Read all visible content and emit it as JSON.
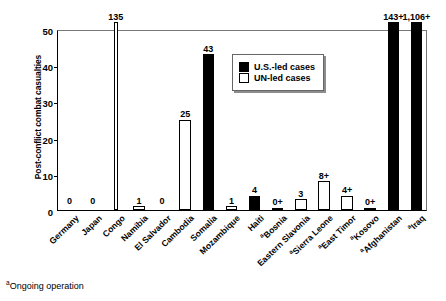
{
  "chart_data": {
    "type": "bar",
    "title": "",
    "xlabel": "",
    "ylabel": "Post-conflict combat casualties",
    "ylim": [
      0,
      50
    ],
    "yticks": [
      0,
      10,
      20,
      30,
      40,
      50
    ],
    "grid": false,
    "legend_position": "inside-top-center",
    "categories": [
      "Germany",
      "Japan",
      "Congo",
      "Namibia",
      "El Salvador",
      "Cambodia",
      "Somalia",
      "Mozambique",
      "Haiti",
      "Bosnia",
      "Eastern Slavonia",
      "Sierra Leone",
      "East Timor",
      "Kosovo",
      "Afghanistan",
      "Iraq"
    ],
    "series": [
      {
        "name": "U.S.-led cases",
        "color": "#000000",
        "values": [
          0,
          0,
          null,
          null,
          null,
          null,
          43,
          null,
          4,
          0,
          null,
          null,
          null,
          0,
          143,
          1106
        ]
      },
      {
        "name": "UN-led cases",
        "color": "#ffffff",
        "values": [
          null,
          null,
          135,
          1,
          0,
          25,
          null,
          1,
          null,
          null,
          3,
          8,
          4,
          null,
          null,
          null
        ]
      }
    ],
    "points": [
      {
        "category": "Germany",
        "label": "0",
        "value": 0,
        "group": "U.S.-led cases",
        "ongoing": false,
        "overflow": false
      },
      {
        "category": "Japan",
        "label": "0",
        "value": 0,
        "group": "U.S.-led cases",
        "ongoing": false,
        "overflow": false
      },
      {
        "category": "Congo",
        "label": "135",
        "value": 135,
        "group": "UN-led cases",
        "ongoing": false,
        "overflow": true
      },
      {
        "category": "Namibia",
        "label": "1",
        "value": 1,
        "group": "UN-led cases",
        "ongoing": false,
        "overflow": false
      },
      {
        "category": "El Salvador",
        "label": "0",
        "value": 0,
        "group": "UN-led cases",
        "ongoing": false,
        "overflow": false
      },
      {
        "category": "Cambodia",
        "label": "25",
        "value": 25,
        "group": "UN-led cases",
        "ongoing": false,
        "overflow": false
      },
      {
        "category": "Somalia",
        "label": "43",
        "value": 43,
        "group": "U.S.-led cases",
        "ongoing": false,
        "overflow": false
      },
      {
        "category": "Mozambique",
        "label": "1",
        "value": 1,
        "group": "UN-led cases",
        "ongoing": false,
        "overflow": false
      },
      {
        "category": "Haiti",
        "label": "4",
        "value": 4,
        "group": "U.S.-led cases",
        "ongoing": false,
        "overflow": false
      },
      {
        "category": "Bosnia",
        "label": "0+",
        "value": 0.3,
        "group": "U.S.-led cases",
        "ongoing": true,
        "overflow": false
      },
      {
        "category": "Eastern Slavonia",
        "label": "3",
        "value": 3,
        "group": "UN-led cases",
        "ongoing": false,
        "overflow": false
      },
      {
        "category": "Sierra Leone",
        "label": "8+",
        "value": 8,
        "group": "UN-led cases",
        "ongoing": true,
        "overflow": false
      },
      {
        "category": "East Timor",
        "label": "4+",
        "value": 4,
        "group": "UN-led cases",
        "ongoing": true,
        "overflow": false
      },
      {
        "category": "Kosovo",
        "label": "0+",
        "value": 0.3,
        "group": "U.S.-led cases",
        "ongoing": true,
        "overflow": false
      },
      {
        "category": "Afghanistan",
        "label": "143+",
        "value": 143,
        "group": "U.S.-led cases",
        "ongoing": true,
        "overflow": true
      },
      {
        "category": "Iraq",
        "label": "1,106+",
        "value": 1106,
        "group": "U.S.-led cases",
        "ongoing": true,
        "overflow": true
      }
    ]
  },
  "axis": {
    "y_title": "Post-conflict combat casualties",
    "y_ticks": [
      "0",
      "10",
      "20",
      "30",
      "40",
      "50"
    ]
  },
  "legend": {
    "items": [
      {
        "label": "U.S.-led cases",
        "swatch": "filled-black-square"
      },
      {
        "label": "UN-led cases",
        "swatch": "open-white-square"
      }
    ]
  },
  "footnote": {
    "marker": "a",
    "text": "Ongoing operation"
  }
}
